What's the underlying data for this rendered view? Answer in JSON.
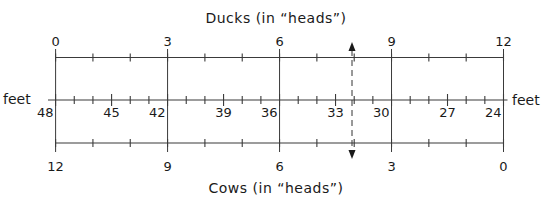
{
  "titles": {
    "top": "Ducks (in “heads”)",
    "bottom": "Cows (in “heads”)"
  },
  "axis_unit_left": "feet",
  "axis_unit_right": "feet",
  "layout": {
    "x_start": 55.6,
    "x_end": 503.5,
    "y_top": 57.5,
    "y_mid": 100,
    "y_bottom": 143,
    "dashed_x": 352
  },
  "ducks_scale": {
    "labels": [
      "0",
      "3",
      "6",
      "9",
      "12"
    ],
    "min": 0,
    "max": 12,
    "major_step": 3,
    "minor_step": 1
  },
  "feet_scale": {
    "labels": [
      "48",
      "45",
      "42",
      "39",
      "36",
      "33",
      "30",
      "27",
      "24"
    ],
    "min": 24,
    "max": 48,
    "label_step": 3,
    "minor_step": 1,
    "direction": "decreasing-left-to-right"
  },
  "cows_scale": {
    "labels": [
      "12",
      "9",
      "6",
      "3",
      "0"
    ],
    "min": 0,
    "max": 12,
    "major_step": 3,
    "minor_step": 1,
    "direction": "decreasing-left-to-right"
  },
  "annotation": {
    "type": "dashed-double-arrow",
    "description": "vertical dashed line with arrowheads at both ends, between 6 and 9 ducks"
  },
  "colors": {
    "ink": "#1a1a1a",
    "line": "#3a3a3a",
    "background": "#ffffff"
  }
}
